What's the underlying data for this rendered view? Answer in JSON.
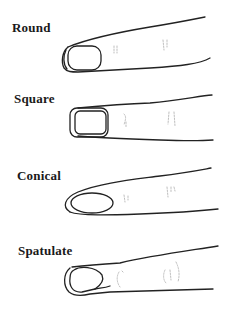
{
  "diagram": {
    "colors": {
      "ink": "#222222",
      "faint": "#b5b5b5",
      "background": "#ffffff"
    },
    "items": [
      {
        "label": "Round",
        "shape": "round-fingertip"
      },
      {
        "label": "Square",
        "shape": "square-fingertip"
      },
      {
        "label": "Conical",
        "shape": "conical-fingertip"
      },
      {
        "label": "Spatulate",
        "shape": "spatulate-fingertip"
      }
    ]
  }
}
